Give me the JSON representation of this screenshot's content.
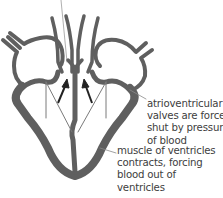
{
  "diagram": {
    "type": "heart-ventricular-systole",
    "colors": {
      "wall": "#5f5f5f",
      "leader_line": "#8a8a8a",
      "arrow": "#222222",
      "text": "#404040"
    },
    "labels": {
      "valves": {
        "lines": [
          "atrioventricular",
          "valves are forced",
          "shut by pressure",
          "of blood"
        ]
      },
      "muscle": {
        "lines": [
          "muscle of ventricles",
          "contracts, forcing",
          "blood out of",
          "ventricles"
        ]
      }
    },
    "arrows": [
      {
        "name": "left-blood-flow-arrow",
        "direction": "up-right"
      },
      {
        "name": "right-blood-flow-arrow",
        "direction": "up-left"
      }
    ]
  }
}
